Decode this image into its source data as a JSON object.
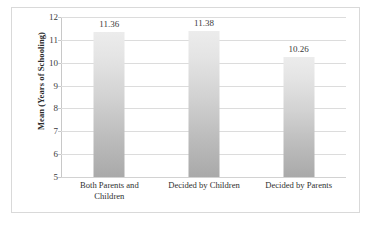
{
  "chart_data": {
    "type": "bar",
    "title": "",
    "subtitle": "",
    "xlabel": "",
    "ylabel": "Mean (Years of Schooling)",
    "categories": [
      "Both Parents and Children",
      "Decided by Children",
      "Decided by Parents"
    ],
    "values": [
      11.36,
      11.38,
      10.26
    ],
    "data_labels": [
      "11.36",
      "11.38",
      "10.26"
    ],
    "ylim": [
      5,
      12
    ],
    "ytick_labels": [
      "5",
      "6",
      "7",
      "8",
      "9",
      "10",
      "11",
      "12"
    ],
    "ytick_values": [
      5,
      6,
      7,
      8,
      9,
      10,
      11,
      12
    ],
    "grid": true,
    "grid_orientation": "horizontal",
    "legend": false,
    "legend_position": "none",
    "series": [
      {
        "name": "Mean Years of Schooling",
        "values": [
          11.36,
          11.38,
          10.26
        ]
      }
    ],
    "colors": {
      "bar_top": "#ececec",
      "bar_bottom": "#a9a9a9",
      "gridline": "#dcdcdc",
      "axis": "#c8c8c8",
      "border": "#d9d9d9",
      "text": "#2f2f2f",
      "background": "#ffffff"
    }
  },
  "axis": {
    "y_title": "Mean (Years of Schooling)"
  },
  "categories_wrapped": [
    [
      "Both Parents and",
      "Children"
    ],
    [
      "Decided by Children"
    ],
    [
      "Decided by Parents"
    ]
  ]
}
